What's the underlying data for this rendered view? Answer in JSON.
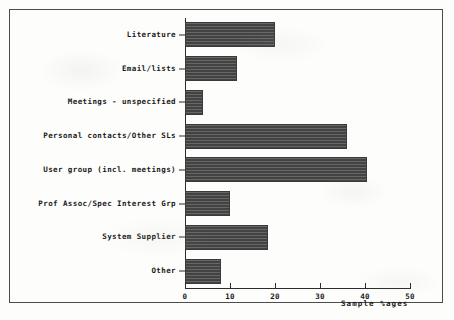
{
  "chart_data": {
    "type": "bar",
    "orientation": "horizontal",
    "title": "",
    "xlabel": "Sample %ages",
    "ylabel": "",
    "xlim": [
      0,
      50
    ],
    "xticks": [
      "0",
      "10",
      "20",
      "30",
      "40",
      "50"
    ],
    "grid": false,
    "legend": null,
    "categories": [
      "Literature",
      "Email/lists",
      "Meetings - unspecified",
      "Personal contacts/Other SLs",
      "User group (incl. meetings)",
      "Prof Assoc/Spec Interest Grp",
      "System Supplier",
      "Other"
    ],
    "values": [
      20,
      11.5,
      4,
      36,
      40.5,
      10,
      18.5,
      8
    ],
    "bar_color": "#4a4a4a",
    "axis_color": "#2b2b2b",
    "frame_color": "#4d4d4d",
    "background_color": "#fdfdfb"
  }
}
